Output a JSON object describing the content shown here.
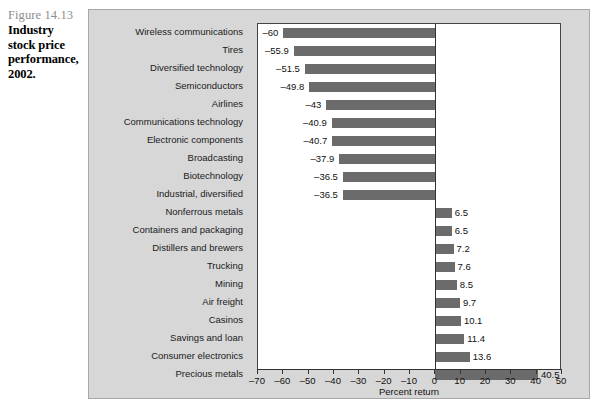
{
  "caption": {
    "figure_number": "Figure 14.13",
    "title": "Industry stock price performance, 2002."
  },
  "chart_data": {
    "type": "bar",
    "orientation": "horizontal",
    "title": "Industry stock price performance, 2002.",
    "xlabel": "Percent return",
    "ylabel": "",
    "xlim": [
      -70,
      50
    ],
    "xticks": [
      -70,
      -60,
      -50,
      -40,
      -30,
      -20,
      -10,
      0,
      10,
      20,
      30,
      40,
      50
    ],
    "xtick_labels": [
      "–70",
      "–60",
      "–50",
      "–40",
      "–30",
      "–20",
      "–10",
      "0",
      "10",
      "20",
      "30",
      "40",
      "50"
    ],
    "grid": false,
    "legend": null,
    "bar_color": "#6b6b6b",
    "plot_background": "#ffffff",
    "panel_background": "#d7d7d7",
    "categories": [
      "Wireless communications",
      "Tires",
      "Diversified technology",
      "Semiconductors",
      "Airlines",
      "Communications technology",
      "Electronic components",
      "Broadcasting",
      "Biotechnology",
      "Industrial, diversified",
      "Nonferrous metals",
      "Containers and packaging",
      "Distillers and brewers",
      "Trucking",
      "Mining",
      "Air freight",
      "Casinos",
      "Savings and loan",
      "Consumer electronics",
      "Precious metals"
    ],
    "values": [
      -60,
      -55.9,
      -51.5,
      -49.8,
      -43,
      -40.9,
      -40.7,
      -37.9,
      -36.5,
      -36.5,
      6.5,
      6.5,
      7.2,
      7.6,
      8.5,
      9.7,
      10.1,
      11.4,
      13.6,
      40.5
    ],
    "value_labels": [
      "–60",
      "–55.9",
      "–51.5",
      "–49.8",
      "–43",
      "–40.9",
      "–40.7",
      "–37.9",
      "–36.5",
      "–36.5",
      "6.5",
      "6.5",
      "7.2",
      "7.6",
      "8.5",
      "9.7",
      "10.1",
      "11.4",
      "13.6",
      "40.5"
    ]
  }
}
